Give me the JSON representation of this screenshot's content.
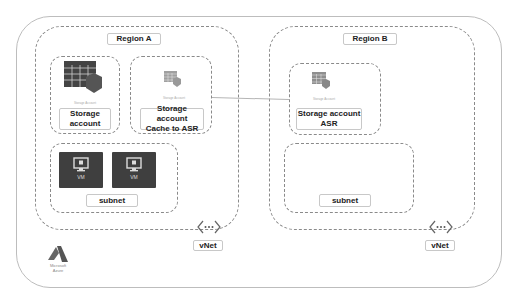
{
  "diagram": {
    "regions": [
      {
        "label": "Region A",
        "storage_boxes": [
          {
            "label_line1": "Storage",
            "label_line2": "account",
            "icon_caption": "Storage Account"
          },
          {
            "label_line1": "Storage account",
            "label_line2": "Cache to ASR",
            "icon_caption": "Storage Account"
          }
        ],
        "subnet": {
          "label": "subnet",
          "vms": [
            {
              "label": "VM"
            },
            {
              "label": "VM"
            }
          ]
        },
        "vnet_label": "vNet"
      },
      {
        "label": "Region B",
        "storage_boxes": [
          {
            "label_line1": "Storage account",
            "label_line2": "ASR",
            "icon_caption": "Storage Account"
          }
        ],
        "subnet": {
          "label": "subnet",
          "vms": []
        },
        "vnet_label": "vNet"
      }
    ],
    "logo": {
      "line1": "Microsoft",
      "line2": "Azure"
    },
    "colors": {
      "dashed_border": "#8a8a8a",
      "icon_dark": "#444444",
      "icon_light": "#9a9a9a"
    }
  }
}
